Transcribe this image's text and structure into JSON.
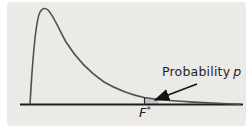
{
  "figure": {
    "type": "density-curve-annotation",
    "labels": {
      "probability_word": "Probability",
      "probability_symbol": "p",
      "critical_letter": "F",
      "critical_sup": "*"
    },
    "colors": {
      "panel_background": "#ECEAE7",
      "page_background": "#FFFFFF",
      "curve": "#4F4F4F",
      "axis": "#1C1C1C",
      "arrow": "#141414",
      "tail_shade": "#C6C4C1",
      "text": "#1F1F1F"
    }
  }
}
